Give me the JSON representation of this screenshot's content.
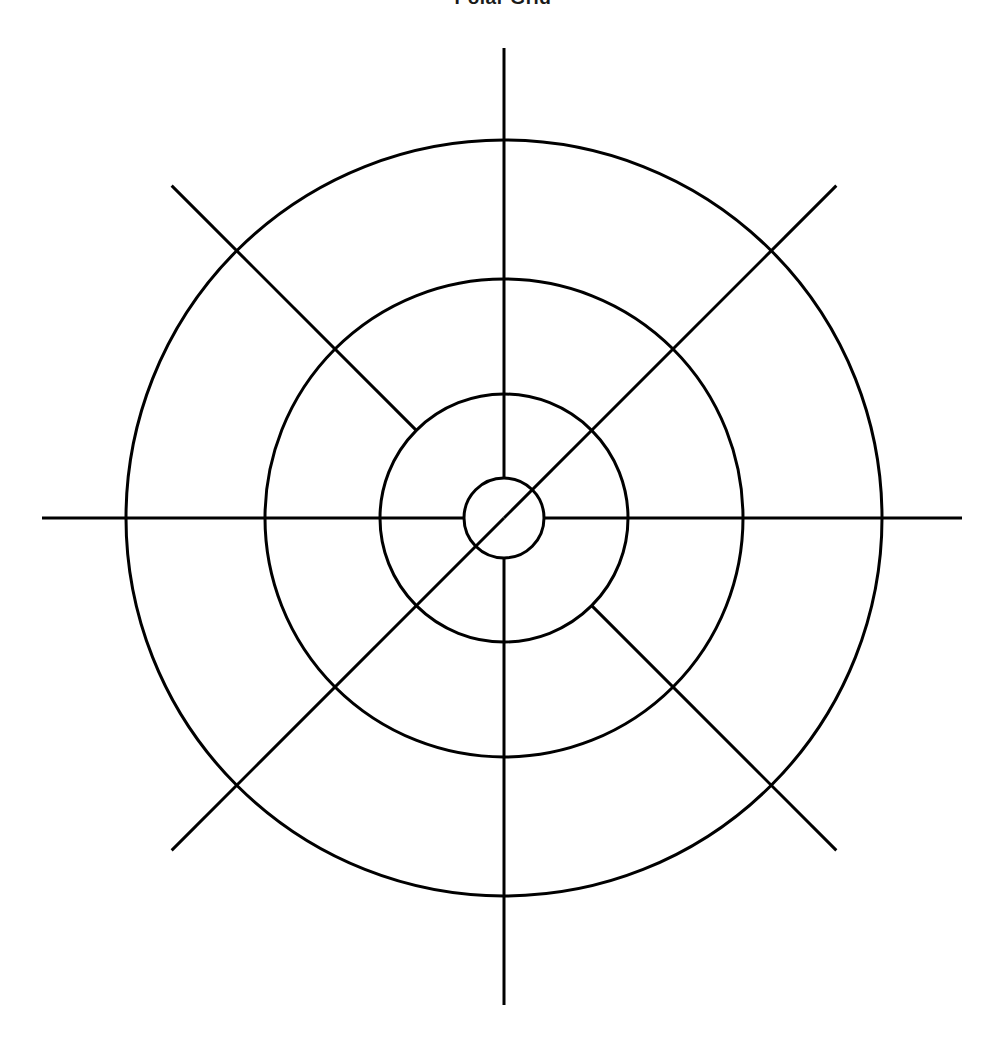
{
  "page": {
    "title": "Polar Grid",
    "background_color": "#ffffff",
    "width": 1006,
    "height": 1056
  },
  "chart_data": {
    "type": "line",
    "title": "Polar Grid",
    "subtitle": "",
    "xlabel": "",
    "ylabel": "",
    "grid": true,
    "legend": "none",
    "projection": "polar",
    "stroke_color": "#000000",
    "stroke_width": 3,
    "center": {
      "x": 504,
      "y": 518
    },
    "radial_rings": [
      {
        "name": "ring-outer",
        "radius": 378
      },
      {
        "name": "ring-middle",
        "radius": 239
      },
      {
        "name": "ring-inner",
        "radius": 124
      },
      {
        "name": "ring-hub",
        "radius": 40
      }
    ],
    "spokes": [
      {
        "name": "spoke-north",
        "angle_deg": 90,
        "inner_radius": 40,
        "outer_radius": 470
      },
      {
        "name": "spoke-south",
        "angle_deg": 270,
        "inner_radius": 40,
        "outer_radius": 487
      },
      {
        "name": "spoke-east",
        "angle_deg": 0,
        "inner_radius": 40,
        "outer_radius": 458
      },
      {
        "name": "spoke-west",
        "angle_deg": 180,
        "inner_radius": 40,
        "outer_radius": 462
      },
      {
        "name": "spoke-northeast",
        "angle_deg": 45,
        "inner_radius": 0,
        "outer_radius": 470
      },
      {
        "name": "spoke-southwest",
        "angle_deg": 225,
        "inner_radius": 0,
        "outer_radius": 470
      },
      {
        "name": "spoke-northwest",
        "angle_deg": 135,
        "inner_radius": 124,
        "outer_radius": 470
      },
      {
        "name": "spoke-southeast",
        "angle_deg": 315,
        "inner_radius": 124,
        "outer_radius": 470
      }
    ],
    "categories": [],
    "values": [],
    "tick_labels": [],
    "annotations": []
  }
}
